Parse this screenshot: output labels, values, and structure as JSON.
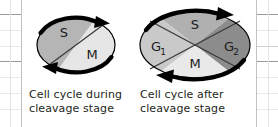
{
  "figure": {
    "background": "#ffffff",
    "ink": "#231f20"
  },
  "diagrams": [
    {
      "id": "cell-cycle-during-cleavage",
      "caption": "Cell cycle during\ncleavage stage",
      "shape": "ellipse",
      "arrow_direction": "clockwise",
      "arrow_color": "#000000",
      "phases": [
        {
          "name": "S",
          "label": "S",
          "fill": "#b5b5b5",
          "position": "upper-left"
        },
        {
          "name": "M",
          "label": "M",
          "fill": "#e6e6e6",
          "position": "lower-right"
        }
      ],
      "divider": "single-diagonal"
    },
    {
      "id": "cell-cycle-after-cleavage",
      "caption": "Cell cycle after\ncleavage stage",
      "shape": "ellipse",
      "arrow_direction": "clockwise",
      "arrow_color": "#000000",
      "phases": [
        {
          "name": "G1",
          "label": "G",
          "sublabel": "1",
          "fill": "#c9c9c9",
          "position": "left"
        },
        {
          "name": "S",
          "label": "S",
          "sublabel": "",
          "fill": "#b0b0b0",
          "position": "top"
        },
        {
          "name": "G2",
          "label": "G",
          "sublabel": "2",
          "fill": "#8c8c8c",
          "position": "right"
        },
        {
          "name": "M",
          "label": "M",
          "sublabel": "",
          "fill": "#e9e9e9",
          "position": "bottom"
        }
      ],
      "divider": "double-diagonal-x"
    }
  ]
}
